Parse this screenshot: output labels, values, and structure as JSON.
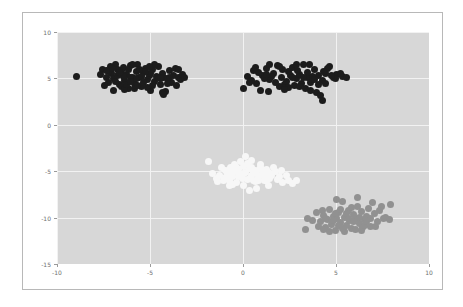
{
  "figure": {
    "background_color": "#ffffff",
    "border_color": "#b8b8b8",
    "plot_background_color": "#d7d7d7",
    "grid_color": "#f2f2f2",
    "tick_label_color": "#6e6e6e"
  },
  "chart_data": {
    "type": "scatter",
    "title": "",
    "xlabel": "",
    "ylabel": "",
    "xlim": [
      -10,
      10
    ],
    "ylim": [
      -15,
      10
    ],
    "xticks": [
      -10,
      -5,
      0,
      5,
      10
    ],
    "yticks": [
      -15,
      -10,
      -5,
      0,
      5,
      10
    ],
    "xticklabels": [
      "-10",
      "-5",
      "0",
      "5",
      "10"
    ],
    "yticklabels": [
      "-15",
      "-10",
      "-5",
      "0",
      "5",
      "10"
    ],
    "grid": true,
    "legend": null,
    "marker_size_px": 7,
    "series": [
      {
        "name": "cluster-top-left",
        "color": "#1c1c1c",
        "points": [
          [
            -8.95,
            5.25
          ],
          [
            -7.55,
            5.95
          ],
          [
            -7.35,
            5.05
          ],
          [
            -7.25,
            4.55
          ],
          [
            -7.15,
            6.25
          ],
          [
            -7.05,
            5.55
          ],
          [
            -6.95,
            4.95
          ],
          [
            -6.85,
            6.55
          ],
          [
            -6.75,
            5.35
          ],
          [
            -6.65,
            4.35
          ],
          [
            -6.55,
            5.85
          ],
          [
            -6.45,
            6.15
          ],
          [
            -6.35,
            4.75
          ],
          [
            -6.25,
            5.45
          ],
          [
            -6.15,
            3.95
          ],
          [
            -6.05,
            6.35
          ],
          [
            -5.95,
            5.15
          ],
          [
            -5.85,
            4.45
          ],
          [
            -5.75,
            5.75
          ],
          [
            -5.65,
            6.45
          ],
          [
            -5.55,
            5.05
          ],
          [
            -5.45,
            4.15
          ],
          [
            -5.35,
            5.65
          ],
          [
            -5.25,
            6.05
          ],
          [
            -5.15,
            4.85
          ],
          [
            -5.05,
            5.35
          ],
          [
            -4.95,
            3.75
          ],
          [
            -4.85,
            5.95
          ],
          [
            -4.75,
            4.65
          ],
          [
            -4.65,
            5.25
          ],
          [
            -4.55,
            6.25
          ],
          [
            -4.45,
            4.35
          ],
          [
            -4.35,
            5.55
          ],
          [
            -4.25,
            5.05
          ],
          [
            -4.15,
            3.55
          ],
          [
            -4.05,
            4.95
          ],
          [
            -3.95,
            5.85
          ],
          [
            -3.85,
            4.55
          ],
          [
            -3.75,
            5.35
          ],
          [
            -3.65,
            6.05
          ],
          [
            -3.55,
            4.25
          ],
          [
            -3.45,
            5.15
          ],
          [
            -3.35,
            4.85
          ],
          [
            -3.25,
            5.45
          ],
          [
            -3.15,
            5.05
          ],
          [
            -7.45,
            4.25
          ],
          [
            -7.65,
            5.45
          ],
          [
            -6.95,
            3.65
          ],
          [
            -6.15,
            5.95
          ],
          [
            -5.95,
            6.55
          ],
          [
            -5.35,
            4.55
          ],
          [
            -4.75,
            6.55
          ],
          [
            -4.35,
            3.45
          ],
          [
            -4.25,
            3.25
          ],
          [
            -6.55,
            4.15
          ],
          [
            -6.35,
            3.85
          ],
          [
            -5.85,
            3.95
          ],
          [
            -5.15,
            4.05
          ],
          [
            -7.25,
            5.75
          ],
          [
            -6.05,
            5.05
          ],
          [
            -5.55,
            5.95
          ],
          [
            -4.95,
            5.55
          ],
          [
            -6.75,
            5.95
          ],
          [
            -6.25,
            4.35
          ],
          [
            -5.65,
            4.25
          ],
          [
            -3.95,
            5.15
          ],
          [
            -3.45,
            5.95
          ],
          [
            -7.05,
            6.05
          ],
          [
            -6.45,
            5.25
          ],
          [
            -5.25,
            5.75
          ],
          [
            -4.55,
            5.05
          ],
          [
            -4.05,
            4.45
          ],
          [
            -6.85,
            4.65
          ],
          [
            -5.75,
            4.95
          ],
          [
            -5.05,
            6.25
          ],
          [
            -4.45,
            4.95
          ],
          [
            -6.65,
            5.65
          ],
          [
            -6.05,
            4.65
          ],
          [
            -5.45,
            5.25
          ],
          [
            -4.85,
            4.25
          ],
          [
            -7.35,
            5.85
          ]
        ]
      },
      {
        "name": "cluster-top-right",
        "color": "#1c1c1c",
        "points": [
          [
            0.25,
            5.25
          ],
          [
            0.55,
            5.85
          ],
          [
            0.75,
            4.45
          ],
          [
            1.05,
            5.35
          ],
          [
            1.25,
            6.05
          ],
          [
            1.45,
            4.85
          ],
          [
            1.65,
            5.55
          ],
          [
            1.85,
            6.35
          ],
          [
            2.05,
            5.05
          ],
          [
            2.25,
            4.35
          ],
          [
            2.45,
            5.75
          ],
          [
            2.65,
            6.15
          ],
          [
            2.85,
            4.95
          ],
          [
            3.05,
            5.45
          ],
          [
            3.25,
            6.45
          ],
          [
            3.45,
            5.15
          ],
          [
            3.65,
            4.55
          ],
          [
            3.85,
            5.95
          ],
          [
            4.05,
            5.35
          ],
          [
            4.25,
            4.75
          ],
          [
            4.45,
            5.55
          ],
          [
            4.65,
            6.25
          ],
          [
            4.85,
            5.05
          ],
          [
            5.05,
            5.45
          ],
          [
            5.35,
            5.25
          ],
          [
            5.55,
            5.05
          ],
          [
            0.05,
            3.95
          ],
          [
            0.95,
            3.75
          ],
          [
            1.35,
            3.55
          ],
          [
            1.95,
            4.15
          ],
          [
            2.75,
            4.25
          ],
          [
            3.35,
            3.95
          ],
          [
            3.95,
            3.45
          ],
          [
            4.15,
            3.15
          ],
          [
            4.25,
            2.65
          ],
          [
            3.15,
            4.45
          ],
          [
            2.15,
            5.95
          ],
          [
            1.55,
            5.25
          ],
          [
            0.85,
            5.65
          ],
          [
            3.55,
            6.55
          ],
          [
            4.55,
            6.05
          ],
          [
            2.35,
            4.65
          ],
          [
            1.15,
            4.95
          ],
          [
            2.95,
            5.85
          ],
          [
            3.75,
            5.25
          ],
          [
            4.35,
            5.75
          ],
          [
            1.75,
            4.55
          ],
          [
            2.55,
            5.35
          ],
          [
            3.05,
            4.15
          ],
          [
            0.65,
            6.15
          ],
          [
            2.85,
            6.55
          ],
          [
            4.05,
            4.35
          ],
          [
            4.95,
            4.95
          ],
          [
            1.25,
            5.45
          ],
          [
            2.45,
            4.05
          ],
          [
            3.45,
            5.65
          ],
          [
            3.85,
            4.85
          ],
          [
            0.45,
            4.75
          ],
          [
            1.95,
            6.25
          ],
          [
            2.65,
            5.15
          ],
          [
            3.25,
            5.05
          ],
          [
            4.75,
            5.35
          ],
          [
            5.25,
            5.55
          ],
          [
            1.45,
            6.45
          ],
          [
            2.25,
            3.85
          ],
          [
            3.65,
            3.65
          ],
          [
            4.45,
            4.45
          ],
          [
            0.35,
            4.55
          ]
        ]
      },
      {
        "name": "cluster-center",
        "color": "#f7f7f7",
        "points": [
          [
            -1.85,
            -3.95
          ],
          [
            -1.25,
            -5.45
          ],
          [
            -1.05,
            -5.95
          ],
          [
            -0.95,
            -4.95
          ],
          [
            -0.85,
            -5.25
          ],
          [
            -0.75,
            -6.05
          ],
          [
            -0.65,
            -4.65
          ],
          [
            -0.55,
            -5.55
          ],
          [
            -0.45,
            -5.05
          ],
          [
            -0.35,
            -6.25
          ],
          [
            -0.25,
            -4.85
          ],
          [
            -0.15,
            -5.35
          ],
          [
            -0.05,
            -5.75
          ],
          [
            0.05,
            -4.45
          ],
          [
            0.15,
            -5.15
          ],
          [
            0.25,
            -5.85
          ],
          [
            0.35,
            -4.75
          ],
          [
            0.45,
            -5.45
          ],
          [
            0.55,
            -6.05
          ],
          [
            0.65,
            -4.95
          ],
          [
            0.75,
            -5.25
          ],
          [
            0.85,
            -5.65
          ],
          [
            0.95,
            -4.55
          ],
          [
            1.05,
            -5.35
          ],
          [
            1.15,
            -5.95
          ],
          [
            1.25,
            -4.85
          ],
          [
            1.35,
            -5.15
          ],
          [
            1.45,
            -5.75
          ],
          [
            1.55,
            -5.45
          ],
          [
            1.75,
            -5.05
          ],
          [
            1.95,
            -5.55
          ],
          [
            2.15,
            -6.25
          ],
          [
            2.45,
            -5.95
          ],
          [
            2.65,
            -6.35
          ],
          [
            0.15,
            -3.45
          ],
          [
            0.45,
            -3.85
          ],
          [
            -0.15,
            -3.95
          ],
          [
            0.35,
            -7.05
          ],
          [
            0.75,
            -6.85
          ],
          [
            1.35,
            -6.55
          ],
          [
            -0.75,
            -6.55
          ],
          [
            -1.45,
            -5.75
          ],
          [
            -1.65,
            -5.25
          ],
          [
            -1.15,
            -4.55
          ],
          [
            -0.45,
            -4.25
          ],
          [
            0.25,
            -4.15
          ],
          [
            0.95,
            -4.25
          ],
          [
            1.65,
            -4.65
          ],
          [
            2.05,
            -4.95
          ],
          [
            -1.35,
            -6.15
          ],
          [
            -0.55,
            -6.45
          ],
          [
            0.05,
            -6.55
          ],
          [
            0.65,
            -6.15
          ],
          [
            1.25,
            -6.05
          ],
          [
            1.85,
            -5.85
          ],
          [
            2.35,
            -5.45
          ],
          [
            -0.95,
            -5.65
          ],
          [
            -0.25,
            -5.55
          ],
          [
            0.55,
            -5.05
          ],
          [
            1.15,
            -5.55
          ],
          [
            -0.65,
            -5.15
          ],
          [
            0.85,
            -5.95
          ],
          [
            1.45,
            -5.25
          ],
          [
            -0.35,
            -4.55
          ],
          [
            0.05,
            -5.25
          ],
          [
            0.45,
            -4.65
          ],
          [
            1.05,
            -4.95
          ],
          [
            2.85,
            -6.05
          ]
        ]
      },
      {
        "name": "cluster-bottom-right",
        "color": "#919191",
        "points": [
          [
            3.45,
            -10.05
          ],
          [
            3.35,
            -11.25
          ],
          [
            3.95,
            -9.45
          ],
          [
            4.15,
            -10.45
          ],
          [
            4.35,
            -9.75
          ],
          [
            4.45,
            -11.05
          ],
          [
            4.55,
            -10.25
          ],
          [
            4.65,
            -9.15
          ],
          [
            4.75,
            -10.75
          ],
          [
            4.85,
            -9.85
          ],
          [
            4.95,
            -11.35
          ],
          [
            5.05,
            -10.05
          ],
          [
            5.15,
            -9.45
          ],
          [
            5.25,
            -10.55
          ],
          [
            5.35,
            -8.25
          ],
          [
            5.45,
            -9.95
          ],
          [
            5.55,
            -10.85
          ],
          [
            5.65,
            -9.25
          ],
          [
            5.75,
            -10.35
          ],
          [
            5.85,
            -11.15
          ],
          [
            5.95,
            -9.65
          ],
          [
            6.05,
            -10.05
          ],
          [
            6.15,
            -8.75
          ],
          [
            6.25,
            -10.65
          ],
          [
            6.35,
            -9.35
          ],
          [
            6.45,
            -11.05
          ],
          [
            6.55,
            -10.25
          ],
          [
            6.65,
            -9.85
          ],
          [
            6.85,
            -10.95
          ],
          [
            7.05,
            -9.55
          ],
          [
            7.25,
            -10.45
          ],
          [
            7.45,
            -8.85
          ],
          [
            7.65,
            -9.95
          ],
          [
            7.85,
            -10.25
          ],
          [
            7.95,
            -8.55
          ],
          [
            6.95,
            -8.35
          ],
          [
            6.15,
            -7.85
          ],
          [
            5.05,
            -8.05
          ],
          [
            4.05,
            -10.95
          ],
          [
            4.25,
            -9.25
          ],
          [
            5.45,
            -11.55
          ],
          [
            6.35,
            -11.35
          ],
          [
            5.85,
            -8.95
          ],
          [
            4.95,
            -9.55
          ],
          [
            5.65,
            -10.05
          ],
          [
            6.75,
            -9.05
          ],
          [
            7.35,
            -9.25
          ],
          [
            4.65,
            -11.45
          ],
          [
            5.25,
            -9.15
          ],
          [
            6.05,
            -11.25
          ],
          [
            6.55,
            -10.85
          ],
          [
            7.15,
            -10.95
          ],
          [
            3.75,
            -10.35
          ],
          [
            4.45,
            -10.05
          ],
          [
            5.15,
            -10.85
          ],
          [
            5.95,
            -10.45
          ],
          [
            6.65,
            -10.45
          ],
          [
            7.55,
            -10.15
          ],
          [
            4.85,
            -10.35
          ],
          [
            5.55,
            -9.55
          ],
          [
            6.25,
            -9.95
          ],
          [
            6.85,
            -10.15
          ],
          [
            5.35,
            -11.15
          ],
          [
            4.35,
            -11.25
          ]
        ]
      }
    ]
  }
}
